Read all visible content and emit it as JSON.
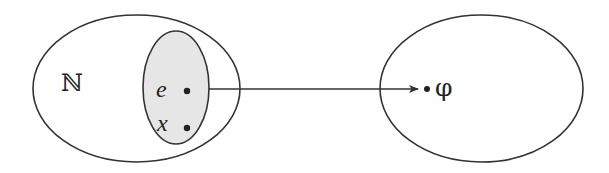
{
  "diagram": {
    "type": "set-mapping",
    "colors": {
      "stroke": "#333333",
      "subset_fill": "#e6e6e6",
      "background": "#ffffff"
    },
    "left_set": {
      "label": "ℕ",
      "subset": {
        "elements": [
          {
            "label": "e"
          },
          {
            "label": "x"
          }
        ]
      }
    },
    "arrow": {
      "from": "subset",
      "to": "φ"
    },
    "right_set": {
      "elements": [
        {
          "label": "φ"
        }
      ]
    }
  }
}
